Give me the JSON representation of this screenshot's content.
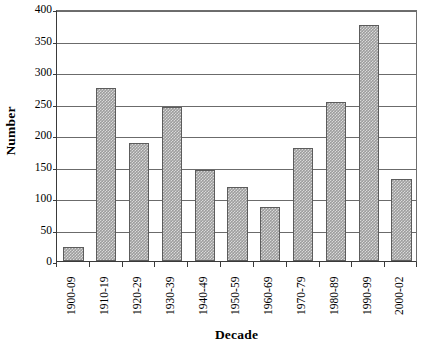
{
  "chart_data": {
    "type": "bar",
    "title": "",
    "xlabel": "Decade",
    "ylabel": "Number",
    "categories": [
      "1900-09",
      "1910-19",
      "1920-29",
      "1930-39",
      "1940-49",
      "1950-59",
      "1960-69",
      "1970-79",
      "1980-89",
      "1990-99",
      "2000-02"
    ],
    "values": [
      23,
      275,
      188,
      245,
      145,
      117,
      86,
      179,
      253,
      375,
      130
    ],
    "ylim": [
      0,
      400
    ],
    "ytick_labels": [
      "0",
      "50",
      "100",
      "150",
      "200",
      "250",
      "300",
      "350",
      "400"
    ],
    "ytick_values": [
      0,
      50,
      100,
      150,
      200,
      250,
      300,
      350,
      400
    ],
    "grid": true,
    "legend": "none",
    "bar_color": "#9d9d9d",
    "bar_border_color": "#5c5c5c",
    "axis_color": "#3a3a3a",
    "gridline_color": "#6b6b6b"
  }
}
